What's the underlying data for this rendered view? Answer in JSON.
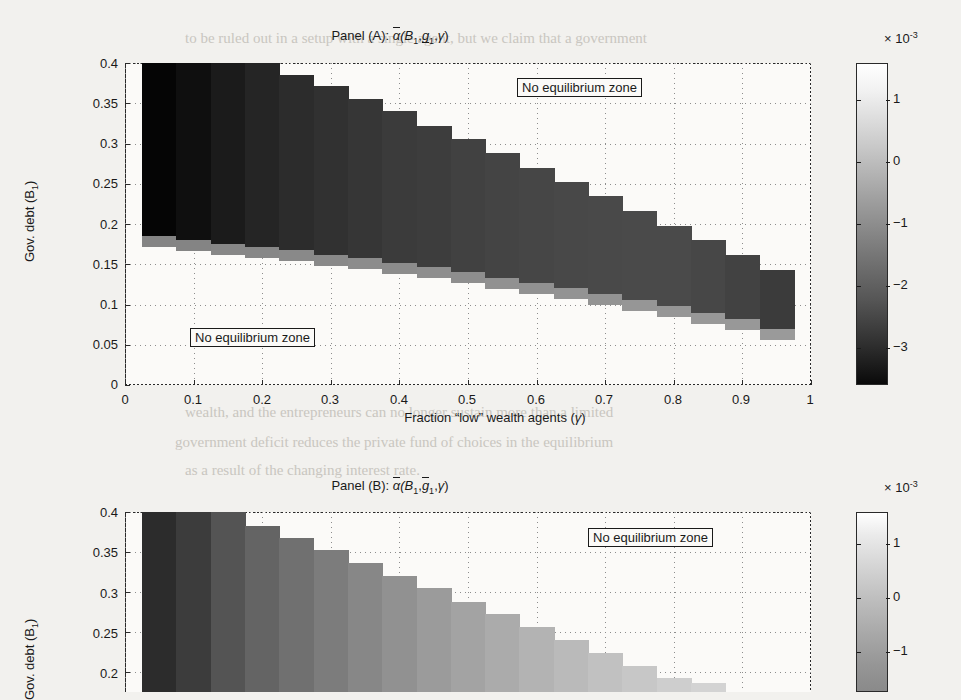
{
  "figure": {
    "background_color": "#f2f1ee",
    "plot_background": "#fbfaf8",
    "axis_color": "#2a2a2a"
  },
  "panelA": {
    "title_prefix": "Panel (A): ",
    "title_alpha": "α",
    "title_args_open": "(B",
    "title_sub1": "1",
    "title_comma1": ",",
    "title_g": "g",
    "title_sub2": "1",
    "title_comma2": ",",
    "title_gamma": "γ",
    "title_close": ")",
    "ylabel_text": "Gov. debt (B",
    "ylabel_sub": "1",
    "ylabel_close": ")",
    "xlabel_text": "Fraction “low” wealth agents (",
    "xlabel_gamma": "γ",
    "xlabel_close": ")",
    "yticks": [
      "0.4",
      "0.35",
      "0.3",
      "0.25",
      "0.2",
      "0.15",
      "0.1",
      "0.05",
      "0"
    ],
    "ytick_values": [
      0.4,
      0.35,
      0.3,
      0.25,
      0.2,
      0.15,
      0.1,
      0.05,
      0
    ],
    "xticks": [
      "0",
      "0.1",
      "0.2",
      "0.3",
      "0.4",
      "0.5",
      "0.6",
      "0.7",
      "0.8",
      "0.9",
      "1"
    ],
    "xtick_values": [
      0,
      0.1,
      0.2,
      0.3,
      0.4,
      0.5,
      0.6,
      0.7,
      0.8,
      0.9,
      1
    ],
    "annotation_top": "No equilibrium zone",
    "annotation_bottom": "No equilibrium zone",
    "colorbar": {
      "exponent_prefix": "× 10",
      "exponent": "-3",
      "ticks": [
        "1",
        "0",
        "−1",
        "−2",
        "−3"
      ],
      "tick_values": [
        1,
        0,
        -1,
        -2,
        -3
      ],
      "vmin": -3.6,
      "vmax": 1.6
    }
  },
  "panelB": {
    "title_prefix": "Panel (B): ",
    "title_alpha": "α",
    "title_args_open": "(B",
    "title_sub1": "1",
    "title_comma1": ",",
    "title_g": "g",
    "title_sub2": "1",
    "title_comma2": ",",
    "title_gamma": "γ",
    "title_close": ")",
    "ylabel_text": "Gov. debt (B",
    "ylabel_sub": "1",
    "ylabel_close": ")",
    "yticks": [
      "0.4",
      "0.35",
      "0.3",
      "0.25",
      "0.2"
    ],
    "ytick_values": [
      0.4,
      0.35,
      0.3,
      0.25,
      0.2
    ],
    "annotation_top": "No equilibrium zone",
    "colorbar": {
      "exponent_prefix": "× 10",
      "exponent": "-3",
      "ticks": [
        "1",
        "0",
        "−1"
      ],
      "tick_values": [
        1,
        0,
        -1
      ],
      "vmin": -1.6,
      "vmax": 1.6
    }
  },
  "chart_data": [
    {
      "type": "heatmap",
      "panel": "A",
      "title": "Panel (A): ā(B₁,g̱₁,γ)",
      "xlabel": "Fraction “low” wealth agents (γ)",
      "ylabel": "Gov. debt (B₁)",
      "xlim": [
        0,
        1
      ],
      "ylim": [
        0,
        0.4
      ],
      "grid": true,
      "colorbar_label": "× 10⁻³",
      "colorbar_range": [
        -3.6,
        1.6
      ],
      "x": [
        0.05,
        0.1,
        0.15,
        0.2,
        0.25,
        0.3,
        0.35,
        0.4,
        0.45,
        0.5,
        0.55,
        0.6,
        0.65,
        0.7,
        0.75,
        0.8,
        0.85,
        0.9,
        0.95
      ],
      "y": [
        0.05,
        0.1,
        0.15,
        0.2,
        0.25,
        0.3,
        0.35,
        0.4
      ],
      "note": "values in units of 1e-3; null = no-equilibrium (white)",
      "columns": [
        {
          "x": 0.05,
          "top": 0.4,
          "bottom": 0.185,
          "value": -3.5,
          "edge_value": -0.9
        },
        {
          "x": 0.1,
          "top": 0.4,
          "bottom": 0.18,
          "value": -3.3,
          "edge_value": -0.9
        },
        {
          "x": 0.15,
          "top": 0.4,
          "bottom": 0.175,
          "value": -3.05,
          "edge_value": -0.85
        },
        {
          "x": 0.2,
          "top": 0.4,
          "bottom": 0.172,
          "value": -2.85,
          "edge_value": -0.85
        },
        {
          "x": 0.25,
          "top": 0.385,
          "bottom": 0.168,
          "value": -2.7,
          "edge_value": -0.8
        },
        {
          "x": 0.3,
          "top": 0.372,
          "bottom": 0.162,
          "value": -2.6,
          "edge_value": -0.8
        },
        {
          "x": 0.35,
          "top": 0.355,
          "bottom": 0.158,
          "value": -2.5,
          "edge_value": -0.75
        },
        {
          "x": 0.4,
          "top": 0.34,
          "bottom": 0.152,
          "value": -2.4,
          "edge_value": -0.75
        },
        {
          "x": 0.45,
          "top": 0.322,
          "bottom": 0.146,
          "value": -2.35,
          "edge_value": -0.7
        },
        {
          "x": 0.5,
          "top": 0.305,
          "bottom": 0.14,
          "value": -2.28,
          "edge_value": -0.7
        },
        {
          "x": 0.55,
          "top": 0.288,
          "bottom": 0.133,
          "value": -2.22,
          "edge_value": -0.65
        },
        {
          "x": 0.6,
          "top": 0.27,
          "bottom": 0.127,
          "value": -2.18,
          "edge_value": -0.65
        },
        {
          "x": 0.65,
          "top": 0.252,
          "bottom": 0.12,
          "value": -2.14,
          "edge_value": -0.6
        },
        {
          "x": 0.7,
          "top": 0.235,
          "bottom": 0.113,
          "value": -2.12,
          "edge_value": -0.6
        },
        {
          "x": 0.75,
          "top": 0.216,
          "bottom": 0.105,
          "value": -2.1,
          "edge_value": -0.55
        },
        {
          "x": 0.8,
          "top": 0.198,
          "bottom": 0.098,
          "value": -2.1,
          "edge_value": -0.55
        },
        {
          "x": 0.85,
          "top": 0.18,
          "bottom": 0.09,
          "value": -2.15,
          "edge_value": -0.5
        },
        {
          "x": 0.9,
          "top": 0.162,
          "bottom": 0.082,
          "value": -2.25,
          "edge_value": -0.5
        },
        {
          "x": 0.95,
          "top": 0.143,
          "bottom": 0.07,
          "value": -2.4,
          "edge_value": -0.45
        }
      ],
      "annotations": [
        {
          "text": "No equilibrium zone",
          "x": 0.72,
          "y": 0.375
        },
        {
          "text": "No equilibrium zone",
          "x": 0.22,
          "y": 0.055
        }
      ]
    },
    {
      "type": "heatmap",
      "panel": "B",
      "title": "Panel (B): ā(B₁,Ḡ₁,γ)",
      "ylabel": "Gov. debt (B₁)",
      "xlim": [
        0,
        1
      ],
      "ylim": [
        0.18,
        0.4
      ],
      "grid": true,
      "colorbar_label": "× 10⁻³",
      "colorbar_range": [
        -1.6,
        1.6
      ],
      "note": "panel cropped by screenshot bottom edge; values in units of 1e-3",
      "columns": [
        {
          "x": 0.05,
          "top": 0.4,
          "value": -1.05
        },
        {
          "x": 0.1,
          "top": 0.4,
          "value": -0.85
        },
        {
          "x": 0.15,
          "top": 0.4,
          "value": -0.55
        },
        {
          "x": 0.2,
          "top": 0.383,
          "value": -0.35
        },
        {
          "x": 0.25,
          "top": 0.368,
          "value": -0.2
        },
        {
          "x": 0.3,
          "top": 0.352,
          "value": -0.05
        },
        {
          "x": 0.35,
          "top": 0.336,
          "value": 0.1
        },
        {
          "x": 0.4,
          "top": 0.32,
          "value": 0.22
        },
        {
          "x": 0.45,
          "top": 0.305,
          "value": 0.34
        },
        {
          "x": 0.5,
          "top": 0.288,
          "value": 0.45
        },
        {
          "x": 0.55,
          "top": 0.272,
          "value": 0.55
        },
        {
          "x": 0.6,
          "top": 0.256,
          "value": 0.65
        },
        {
          "x": 0.65,
          "top": 0.24,
          "value": 0.74
        },
        {
          "x": 0.7,
          "top": 0.224,
          "value": 0.82
        },
        {
          "x": 0.75,
          "top": 0.208,
          "value": 0.9
        },
        {
          "x": 0.8,
          "top": 0.193,
          "value": 0.98
        },
        {
          "x": 0.85,
          "top": 0.186,
          "value": 1.05
        }
      ],
      "annotations": [
        {
          "text": "No equilibrium zone",
          "x": 0.72,
          "y": 0.365
        }
      ]
    }
  ],
  "bleed_text": {
    "lines": [
      "to be ruled out in a setup with a single agent, but we claim that a government",
      "and the agents, then government revenue would be a function of the aggregate",
      "of steps is ruled out until we reach the relevant policy-maker.",
      "3.2 The Fiscal Government, the equilibrium",
      "We now turn to the basic mechanism which underpins the",
      "instruments available in the hands of the generic Government",
      "indebtedness: at some point the government debt, when the required payment",
      "by the debtors to the creditors, so the interest rate becomes a significant",
      "charge on output and capital, and the market price has to react to this",
      "wealth, and the entrepreneurs can no longer sustain more than a limited",
      "government deficit reduces the private fund of choices in the equilibrium",
      "as a result of the changing interest rate."
    ]
  }
}
